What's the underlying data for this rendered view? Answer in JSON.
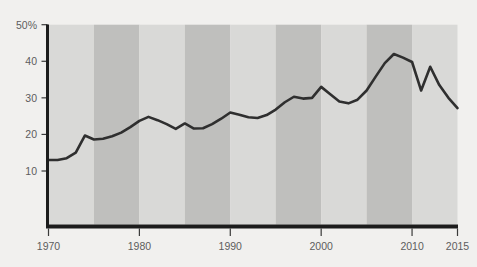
{
  "chart_data": {
    "type": "line",
    "title": "",
    "subtitle": "",
    "xlabel": "",
    "ylabel": "",
    "xlim": [
      1970,
      2015
    ],
    "ylim": [
      0,
      50
    ],
    "grid": false,
    "legend": null,
    "y_ticks": [
      {
        "value": 50,
        "label": "50%"
      },
      {
        "value": 40,
        "label": "40"
      },
      {
        "value": 30,
        "label": "30"
      },
      {
        "value": 20,
        "label": "20"
      },
      {
        "value": 10,
        "label": "10"
      }
    ],
    "x_ticks": [
      {
        "value": 1970,
        "label": "1970"
      },
      {
        "value": 1980,
        "label": "1980"
      },
      {
        "value": 1990,
        "label": "1990"
      },
      {
        "value": 2000,
        "label": "2000"
      },
      {
        "value": 2010,
        "label": "2010"
      },
      {
        "value": 2015,
        "label": "2015"
      }
    ],
    "bands": [
      {
        "start": 1970,
        "end": 1975,
        "shade": "light"
      },
      {
        "start": 1975,
        "end": 1980,
        "shade": "dark"
      },
      {
        "start": 1980,
        "end": 1985,
        "shade": "light"
      },
      {
        "start": 1985,
        "end": 1990,
        "shade": "dark"
      },
      {
        "start": 1990,
        "end": 1995,
        "shade": "light"
      },
      {
        "start": 1995,
        "end": 2000,
        "shade": "dark"
      },
      {
        "start": 2000,
        "end": 2005,
        "shade": "light"
      },
      {
        "start": 2005,
        "end": 2010,
        "shade": "dark"
      },
      {
        "start": 2010,
        "end": 2015,
        "shade": "light"
      }
    ],
    "x": [
      1970,
      1971,
      1972,
      1973,
      1974,
      1975,
      1976,
      1977,
      1978,
      1979,
      1980,
      1981,
      1982,
      1983,
      1984,
      1985,
      1986,
      1987,
      1988,
      1989,
      1990,
      1991,
      1992,
      1993,
      1994,
      1995,
      1996,
      1997,
      1998,
      1999,
      2000,
      2001,
      2002,
      2003,
      2004,
      2005,
      2006,
      2007,
      2008,
      2009,
      2010,
      2011,
      2012,
      2013,
      2014,
      2015
    ],
    "values": [
      13.0,
      13.0,
      13.5,
      15.0,
      19.7,
      18.6,
      18.8,
      19.5,
      20.5,
      22.0,
      23.7,
      24.8,
      23.9,
      22.8,
      21.5,
      23.0,
      21.6,
      21.7,
      22.8,
      24.3,
      26.0,
      25.4,
      24.7,
      24.5,
      25.3,
      26.8,
      28.8,
      30.3,
      29.8,
      30.0,
      33.0,
      31.0,
      29.0,
      28.5,
      29.5,
      32.0,
      35.8,
      39.5,
      42.0,
      41.0,
      39.8,
      32.0,
      38.5,
      33.5,
      30.0,
      27.2
    ],
    "colors": {
      "line": "#2f2f2f",
      "band_light": "#d9d9d7",
      "band_dark": "#bfbfbd",
      "axis": "#1c1c1c",
      "background": "#f1f0ee",
      "tick_label": "#5d5d5d"
    }
  }
}
